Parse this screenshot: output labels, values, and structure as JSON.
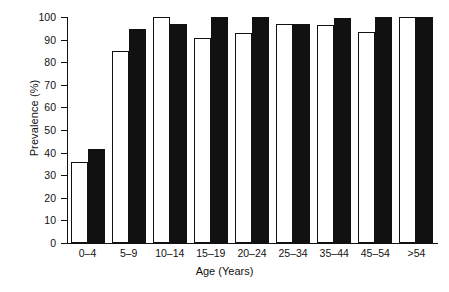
{
  "chart_data": {
    "type": "bar",
    "title": "",
    "xlabel": "Age (Years)",
    "ylabel": "Prevalence (%)",
    "ylim": [
      0,
      100
    ],
    "yticks": [
      0,
      10,
      20,
      30,
      40,
      50,
      60,
      70,
      80,
      90,
      100
    ],
    "grid": false,
    "legend": "none",
    "categories": [
      "0–4",
      "5–9",
      "10–14",
      "15–19",
      "20–24",
      "25–34",
      "35–44",
      "45–54",
      ">54"
    ],
    "series": [
      {
        "name": "open",
        "fill": "#ffffff",
        "edge": "#111111",
        "values": [
          36,
          85,
          100,
          90.5,
          93,
          97,
          96.5,
          93.5,
          100
        ]
      },
      {
        "name": "filled",
        "fill": "#111111",
        "edge": "#111111",
        "values": [
          41.5,
          94.5,
          97,
          100,
          100,
          97,
          99.5,
          100,
          100
        ]
      }
    ]
  },
  "axis": {
    "y_title": "Prevalence (%)",
    "x_title": "Age (Years)",
    "y_tick_labels": [
      "100",
      "90",
      "80",
      "70",
      "60",
      "50",
      "40",
      "30",
      "20",
      "10",
      "0"
    ],
    "x_tick_labels": [
      "0–4",
      "5–9",
      "10–14",
      "15–19",
      "20–24",
      "25–34",
      "35–44",
      "45–54",
      ">54"
    ]
  },
  "colors": {
    "axis": "#111111",
    "open_bar": "#ffffff",
    "filled_bar": "#111111",
    "background": "#ffffff"
  }
}
